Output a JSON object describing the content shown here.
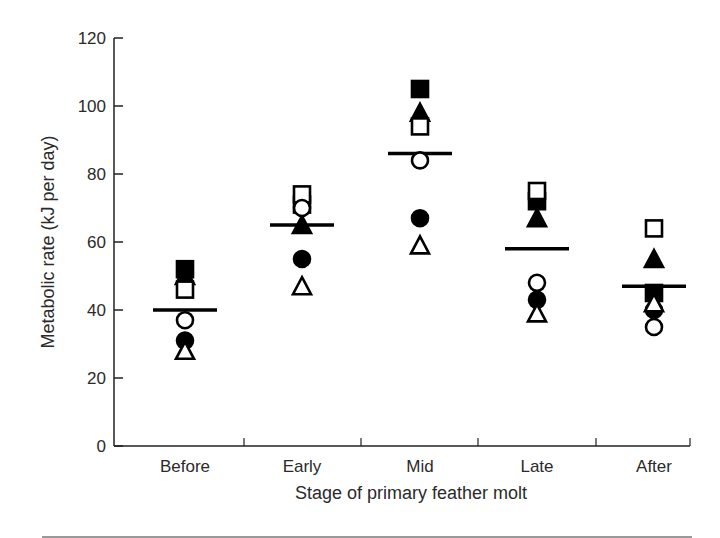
{
  "chart_data": {
    "type": "scatter",
    "title": "",
    "xlabel": "Stage of primary feather molt",
    "ylabel": "Metabolic rate (kJ per day)",
    "ylim": [
      0,
      120
    ],
    "yticks": [
      0,
      20,
      40,
      60,
      80,
      100,
      120
    ],
    "grid": false,
    "legend": null,
    "categories": [
      "Before",
      "Early",
      "Mid",
      "Late",
      "After"
    ],
    "series": [
      {
        "name": "filled-square",
        "marker": "square",
        "filled": true,
        "values": [
          52,
          71,
          105,
          72,
          45
        ]
      },
      {
        "name": "filled-triangle",
        "marker": "triangle",
        "filled": true,
        "values": [
          50,
          65,
          98,
          67,
          55
        ]
      },
      {
        "name": "open-square",
        "marker": "square",
        "filled": false,
        "values": [
          46,
          74,
          94,
          75,
          64
        ]
      },
      {
        "name": "open-circle",
        "marker": "circle",
        "filled": false,
        "values": [
          37,
          70,
          84,
          48,
          35
        ]
      },
      {
        "name": "filled-circle",
        "marker": "circle",
        "filled": true,
        "values": [
          31,
          55,
          67,
          43,
          40
        ]
      },
      {
        "name": "open-triangle",
        "marker": "triangle",
        "filled": false,
        "values": [
          28,
          47,
          59,
          39,
          42
        ]
      }
    ],
    "means": [
      40,
      65,
      86,
      58,
      47
    ]
  }
}
